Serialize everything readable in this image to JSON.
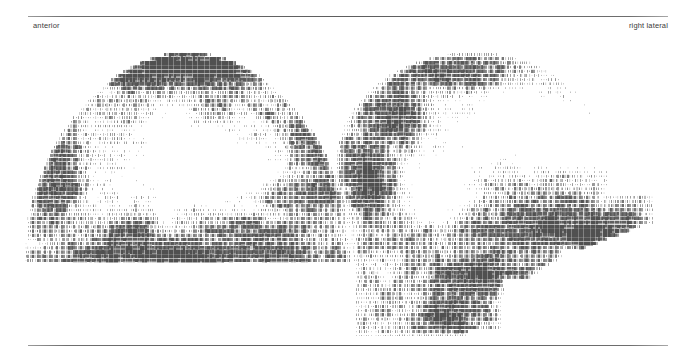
{
  "figure": {
    "kind": "bone-scintigraphy-skull-pair",
    "modality_render": "dot-matrix character density grayscale",
    "background_color": "#ffffff",
    "ink_color": "#4a4a4a",
    "rules": {
      "top_label": "horizontal-rule-top",
      "bottom_label": "horizontal-rule-bottom",
      "color": "#5d5d5d"
    }
  },
  "labels": {
    "left_view": "anterior",
    "right_view": "right lateral"
  },
  "scans": [
    {
      "name": "anterior-skull-scan",
      "view": "anterior",
      "silhouette": "dome",
      "width": 330,
      "height": 220,
      "cell_w": 2.4,
      "cell_h": 4.2,
      "seed": 20317,
      "hotspots": [
        {
          "cx": 0.5,
          "cy": 0.1,
          "rx": 0.3,
          "ry": 0.09,
          "gain": 0.62
        },
        {
          "cx": 0.36,
          "cy": 0.14,
          "rx": 0.14,
          "ry": 0.07,
          "gain": 0.5
        },
        {
          "cx": 0.63,
          "cy": 0.13,
          "rx": 0.13,
          "ry": 0.07,
          "gain": 0.46
        },
        {
          "cx": 0.08,
          "cy": 0.52,
          "rx": 0.1,
          "ry": 0.26,
          "gain": 0.52
        },
        {
          "cx": 0.92,
          "cy": 0.52,
          "rx": 0.1,
          "ry": 0.26,
          "gain": 0.5
        },
        {
          "cx": 0.5,
          "cy": 0.96,
          "rx": 0.46,
          "ry": 0.07,
          "gain": 0.7
        },
        {
          "cx": 0.3,
          "cy": 0.86,
          "rx": 0.16,
          "ry": 0.08,
          "gain": 0.42
        },
        {
          "cx": 0.7,
          "cy": 0.86,
          "rx": 0.16,
          "ry": 0.08,
          "gain": 0.4
        }
      ],
      "coldspots": [
        {
          "cx": 0.46,
          "cy": 0.52,
          "rx": 0.26,
          "ry": 0.26,
          "gain": 0.72
        },
        {
          "cx": 0.62,
          "cy": 0.58,
          "rx": 0.16,
          "ry": 0.18,
          "gain": 0.55
        }
      ]
    },
    {
      "name": "right-lateral-skull-scan",
      "view": "right lateral",
      "silhouette": "head-profile",
      "width": 340,
      "height": 288,
      "cell_w": 2.4,
      "cell_h": 4.2,
      "seed": 48851,
      "hotspots": [
        {
          "cx": 0.34,
          "cy": 0.09,
          "rx": 0.22,
          "ry": 0.07,
          "gain": 0.56
        },
        {
          "cx": 0.18,
          "cy": 0.24,
          "rx": 0.1,
          "ry": 0.1,
          "gain": 0.66
        },
        {
          "cx": 0.1,
          "cy": 0.44,
          "rx": 0.09,
          "ry": 0.16,
          "gain": 0.58
        },
        {
          "cx": 0.58,
          "cy": 0.62,
          "rx": 0.22,
          "ry": 0.1,
          "gain": 0.6
        },
        {
          "cx": 0.72,
          "cy": 0.64,
          "rx": 0.12,
          "ry": 0.07,
          "gain": 0.62
        },
        {
          "cx": 0.4,
          "cy": 0.78,
          "rx": 0.18,
          "ry": 0.08,
          "gain": 0.58
        },
        {
          "cx": 0.33,
          "cy": 0.92,
          "rx": 0.1,
          "ry": 0.08,
          "gain": 0.72
        },
        {
          "cx": 0.86,
          "cy": 0.6,
          "rx": 0.1,
          "ry": 0.06,
          "gain": 0.44
        }
      ],
      "coldspots": [
        {
          "cx": 0.52,
          "cy": 0.26,
          "rx": 0.26,
          "ry": 0.16,
          "gain": 0.78
        },
        {
          "cx": 0.3,
          "cy": 0.46,
          "rx": 0.14,
          "ry": 0.16,
          "gain": 0.6
        },
        {
          "cx": 0.72,
          "cy": 0.34,
          "rx": 0.18,
          "ry": 0.14,
          "gain": 0.58
        }
      ]
    }
  ]
}
